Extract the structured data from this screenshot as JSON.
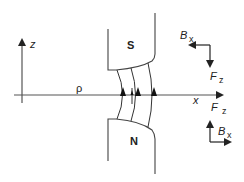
{
  "diagram": {
    "type": "magnet-pole-gap-field",
    "axes": {
      "z_label": "z",
      "x_label": "x",
      "rho_label": "ρ"
    },
    "poles": {
      "top_label": "S",
      "bottom_label": "N"
    },
    "vector_diagrams": [
      {
        "position": "upper-right",
        "b_label": "B",
        "b_sub": "x",
        "f_label": "F",
        "f_sub": "z",
        "b_direction": "left",
        "f_direction": "down"
      },
      {
        "position": "lower-right",
        "b_label": "B",
        "b_sub": "x",
        "f_label": "F",
        "f_sub": "z",
        "b_direction": "right",
        "f_direction": "up"
      }
    ],
    "field_lines_count": 4,
    "colors": {
      "line": "#333333",
      "background": "#ffffff"
    }
  }
}
